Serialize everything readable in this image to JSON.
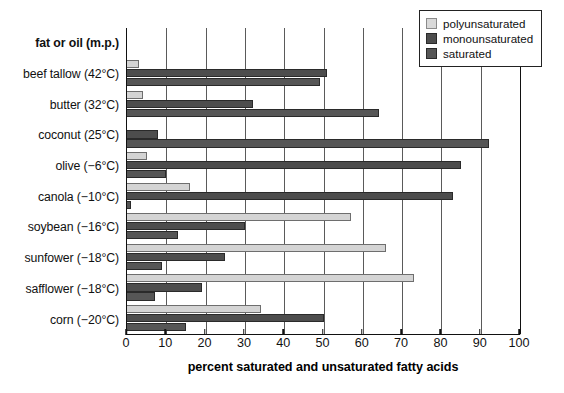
{
  "chart_data": {
    "type": "bar",
    "orientation": "horizontal",
    "title": "",
    "xlabel": "percent saturated and unsaturated fatty acids",
    "ylabel": "fat or oil (m.p.)",
    "xlim": [
      0,
      100
    ],
    "xticks": [
      0,
      10,
      20,
      30,
      40,
      50,
      60,
      70,
      80,
      90,
      100
    ],
    "grid": true,
    "legend_position": "top-right",
    "categories": [
      "beef tallow (42°C)",
      "butter (32°C)",
      "coconut (25°C)",
      "olive (−6°C)",
      "canola (−10°C)",
      "soybean (−16°C)",
      "sunfower (−18°C)",
      "safflower (−18°C)",
      "corn (−20°C)"
    ],
    "series": [
      {
        "name": "polyunsaturated",
        "color": "#d9d9d9",
        "values": [
          3,
          4,
          0,
          5,
          16,
          57,
          66,
          73,
          34
        ]
      },
      {
        "name": "monounsaturated",
        "color": "#4d4d4d",
        "values": [
          51,
          32,
          8,
          85,
          83,
          30,
          25,
          19,
          50
        ]
      },
      {
        "name": "saturated",
        "color": "#565656",
        "values": [
          49,
          64,
          92,
          10,
          1,
          13,
          9,
          7,
          15
        ]
      }
    ]
  },
  "axis": {
    "y_header": "fat or oil (m.p.)",
    "x_title": "percent saturated and unsaturated fatty acids",
    "tick_labels": [
      "0",
      "10",
      "20",
      "30",
      "40",
      "50",
      "60",
      "70",
      "80",
      "90",
      "100"
    ]
  },
  "legend": {
    "items": [
      {
        "label": "polyunsaturated",
        "swatch": "poly"
      },
      {
        "label": "monounsaturated",
        "swatch": "mono"
      },
      {
        "label": "saturated",
        "swatch": "sat"
      }
    ]
  },
  "colors": {
    "polyunsaturated": "#d9d9d9",
    "monounsaturated": "#4d4d4d",
    "saturated": "#565656",
    "axis": "#111111",
    "grid": "#5a5a5a"
  }
}
